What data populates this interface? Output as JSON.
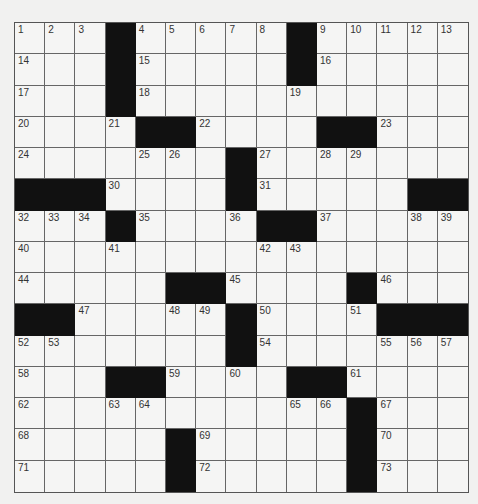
{
  "puzzle": {
    "rows": 15,
    "cols": 15,
    "colors": {
      "block": "#111111",
      "cell": "#f5f5f4",
      "line": "#666666",
      "number": "#333333"
    },
    "grid": [
      [
        "1",
        "2",
        "3",
        "#",
        "4",
        "5",
        "6",
        "7",
        "8",
        "#",
        "9",
        "10",
        "11",
        "12",
        "13"
      ],
      [
        "14",
        "",
        "",
        "#",
        "15",
        "",
        "",
        "",
        "",
        "#",
        "16",
        "",
        "",
        "",
        ""
      ],
      [
        "17",
        "",
        "",
        "#",
        "18",
        "",
        "",
        "",
        "",
        "19",
        "",
        "",
        "",
        "",
        ""
      ],
      [
        "20",
        "",
        "",
        "21",
        "#",
        "#",
        "22",
        "",
        "",
        "",
        "#",
        "#",
        "23",
        "",
        ""
      ],
      [
        "24",
        "",
        "",
        "",
        "25",
        "26",
        "",
        "#",
        "27",
        "",
        "28",
        "29",
        "",
        "",
        ""
      ],
      [
        "#",
        "#",
        "#",
        "30",
        "",
        "",
        "",
        "#",
        "31",
        "",
        "",
        "",
        "",
        "#",
        "#"
      ],
      [
        "32",
        "33",
        "34",
        "#",
        "35",
        "",
        "",
        "36",
        "#",
        "#",
        "37",
        "",
        "",
        "38",
        "39"
      ],
      [
        "40",
        "",
        "",
        "41",
        "",
        "",
        "",
        "",
        "42",
        "43",
        "",
        "",
        "",
        "",
        ""
      ],
      [
        "44",
        "",
        "",
        "",
        "",
        "#",
        "#",
        "45",
        "",
        "",
        "",
        "#",
        "46",
        "",
        ""
      ],
      [
        "#",
        "#",
        "47",
        "",
        "",
        "48",
        "49",
        "#",
        "50",
        "",
        "",
        "51",
        "#",
        "#",
        "#"
      ],
      [
        "52",
        "53",
        "",
        "",
        "",
        "",
        "",
        "#",
        "54",
        "",
        "",
        "",
        "55",
        "56",
        "57"
      ],
      [
        "58",
        "",
        "",
        "#",
        "#",
        "59",
        "",
        "60",
        "",
        "#",
        "#",
        "61",
        "",
        "",
        ""
      ],
      [
        "62",
        "",
        "",
        "63",
        "64",
        "",
        "",
        "",
        "",
        "65",
        "66",
        "#",
        "67",
        "",
        ""
      ],
      [
        "68",
        "",
        "",
        "",
        "",
        "#",
        "69",
        "",
        "",
        "",
        "",
        "#",
        "70",
        "",
        ""
      ],
      [
        "71",
        "",
        "",
        "",
        "",
        "#",
        "72",
        "",
        "",
        "",
        "",
        "#",
        "73",
        "",
        ""
      ]
    ]
  }
}
